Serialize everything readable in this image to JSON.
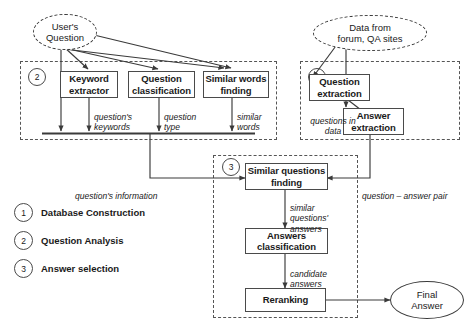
{
  "diagram": {
    "nodes": {
      "users_question": "User's\nQuestion",
      "data_from_forum": "Data from\nforum, QA sites",
      "keyword_extractor": "Keyword\nextractor",
      "question_classification": "Question\nclassification",
      "similar_words_finding": "Similar words\nfinding",
      "question_extraction": "Question\nextraction",
      "answer_extraction": "Answer\nextraction",
      "similar_questions_finding": "Similar questions\nfinding",
      "answers_classification": "Answers\nclassification",
      "reranking": "Reranking",
      "final_answer": "Final\nAnswer"
    },
    "edge_labels": {
      "questions_keywords": "question's\nkeywords",
      "question_type": "question\ntype",
      "similar_words": "similar\nwords",
      "questions_in_data": "questions in\ndata",
      "questions_information": "question's information",
      "question_answer_pair": "question – answer pair",
      "similar_questions_answers": "similar\nquestions'\nanswers",
      "candidate_answers": "candidate\nanswers"
    },
    "group_badges": {
      "one": "1",
      "two": "2",
      "three": "3"
    },
    "legend": [
      {
        "number": "1",
        "label": "Database Construction"
      },
      {
        "number": "2",
        "label": "Question Analysis"
      },
      {
        "number": "3",
        "label": "Answer selection"
      }
    ],
    "colors": {
      "line": "#3a3a3a",
      "box_border": "#4a4a4a",
      "dashed_group": "#555555",
      "text": "#1a1a1a",
      "background": "#ffffff"
    }
  }
}
